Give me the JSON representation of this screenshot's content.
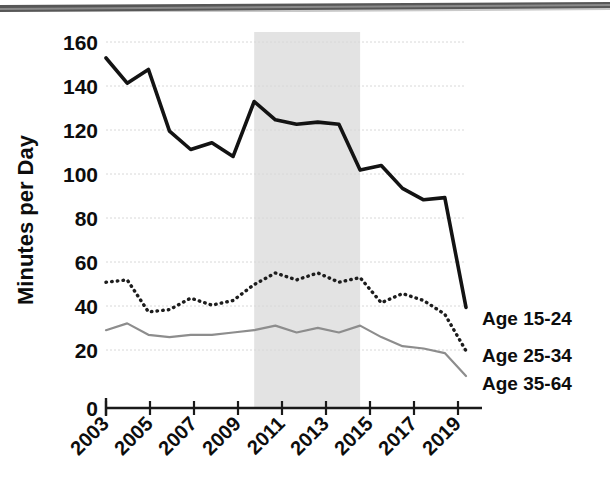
{
  "figure": {
    "alt_name": "time-use-minutes-per-day-by-age-line-chart",
    "has_scan_artifact": true
  },
  "chart_data": {
    "type": "line",
    "title": "",
    "subtitle": "",
    "xlabel": "",
    "ylabel": "Minutes per Day",
    "xlim": [
      2003,
      2020
    ],
    "ylim": [
      0,
      160
    ],
    "grid": true,
    "legend_position": "right-inline",
    "x": [
      2003,
      2004,
      2005,
      2006,
      2007,
      2008,
      2009,
      2010,
      2011,
      2012,
      2013,
      2014,
      2015,
      2016,
      2017,
      2018,
      2019,
      2020
    ],
    "xticks": [
      2003,
      2005,
      2007,
      2009,
      2011,
      2013,
      2015,
      2017,
      2019
    ],
    "xtick_labels": [
      "2003",
      "2005",
      "2007",
      "2009",
      "2011",
      "2013",
      "2015",
      "2017",
      "2019"
    ],
    "yticks": [
      0,
      20,
      40,
      60,
      80,
      100,
      120,
      140,
      160
    ],
    "ytick_labels": [
      "0",
      "20",
      "40",
      "60",
      "80",
      "100",
      "120",
      "140",
      "160"
    ],
    "series": [
      {
        "name": "Age 15-24",
        "style": "solid-thick",
        "color": "#131313",
        "values": [
          153,
          142,
          148,
          121,
          113,
          116,
          110,
          134,
          126,
          124,
          125,
          124,
          104,
          106,
          96,
          91,
          92,
          44
        ]
      },
      {
        "name": "Age 25-34",
        "style": "dotted",
        "color": "#1d1d1d",
        "values": [
          55,
          56,
          42,
          43,
          48,
          45,
          47,
          54,
          59,
          56,
          59,
          55,
          57,
          46,
          50,
          47,
          41,
          25
        ]
      },
      {
        "name": "Age 35-64",
        "style": "solid-thin",
        "color": "#8d8d8d",
        "values": [
          34,
          37,
          32,
          31,
          32,
          32,
          33,
          34,
          36,
          33,
          35,
          33,
          36,
          31,
          27,
          26,
          24,
          14
        ]
      }
    ],
    "shaded_regions": [
      {
        "name": "highlight-band",
        "x_start": 2010,
        "x_end": 2015,
        "color": "#e3e3e3"
      }
    ],
    "legend_entries": [
      {
        "label": "Age 15-24"
      },
      {
        "label": "Age 25-34"
      },
      {
        "label": "Age 35-64"
      }
    ]
  }
}
